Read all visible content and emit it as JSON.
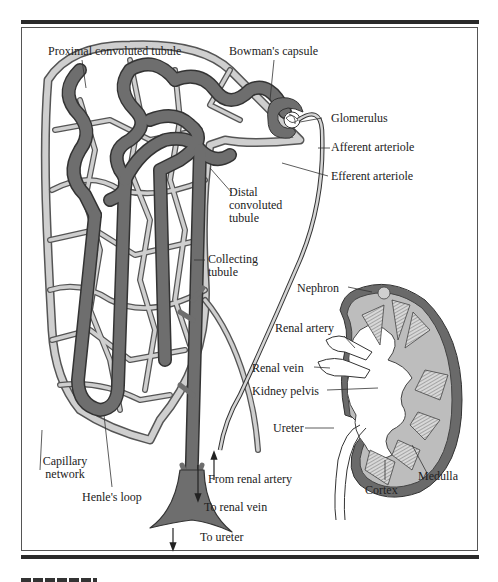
{
  "figure": {
    "colors": {
      "tubule": "#6e6e6e",
      "capillary_fill": "#c9c9c9",
      "kidney_cortex": "#bdbdbd",
      "kidney_capsule": "#6a6a6a",
      "frame": "#2a2a2a"
    },
    "nephron_labels": {
      "proximal": "Proximal convoluted tubule",
      "bowman": "Bowman's capsule",
      "glomerulus": "Glomerulus",
      "afferent": "Afferent arteriole",
      "efferent": "Efferent arteriole",
      "distal_1": "Distal",
      "distal_2": "convoluted",
      "distal_3": "tubule",
      "collecting_1": "Collecting",
      "collecting_2": "tubule",
      "capillary_1": "Capillary",
      "capillary_2": "network",
      "henle": "Henle's loop",
      "from_artery": "From renal artery",
      "to_vein": "To renal vein",
      "to_ureter": "To ureter"
    },
    "kidney_labels": {
      "nephron": "Nephron",
      "renal_artery": "Renal artery",
      "renal_vein": "Renal vein",
      "pelvis": "Kidney pelvis",
      "ureter": "Ureter",
      "cortex": "Cortex",
      "medulla": "Medulla"
    }
  }
}
